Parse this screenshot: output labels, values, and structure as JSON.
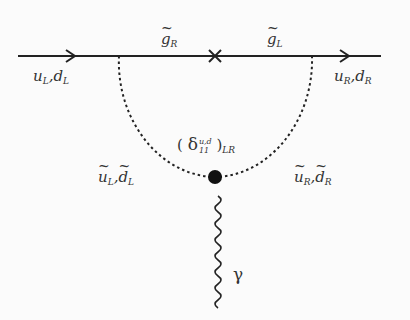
{
  "diagram": {
    "type": "feynman",
    "external_lines": {
      "incoming": {
        "particle": "u",
        "second": "d",
        "chirality": "L",
        "label": "u_L, d_L"
      },
      "outgoing": {
        "particle": "u",
        "second": "d",
        "chirality": "R",
        "label": "u_R, d_R"
      }
    },
    "internal_lines": {
      "gluino_left_segment": {
        "label_base": "g",
        "label_sub": "R"
      },
      "gluino_right_segment": {
        "label_base": "g",
        "label_sub": "L"
      },
      "squark_left": {
        "label_a": "u",
        "label_b": "d",
        "sub": "L"
      },
      "squark_right": {
        "label_a": "u",
        "label_b": "d",
        "sub": "R"
      }
    },
    "insertion": {
      "open": "(",
      "symbol": "δ",
      "sup": "u,d",
      "sub": "11",
      "close": ")",
      "outer_sub": "LR"
    },
    "photon": {
      "label": "γ"
    },
    "mass_insertion_marker": "×",
    "separator": ","
  }
}
